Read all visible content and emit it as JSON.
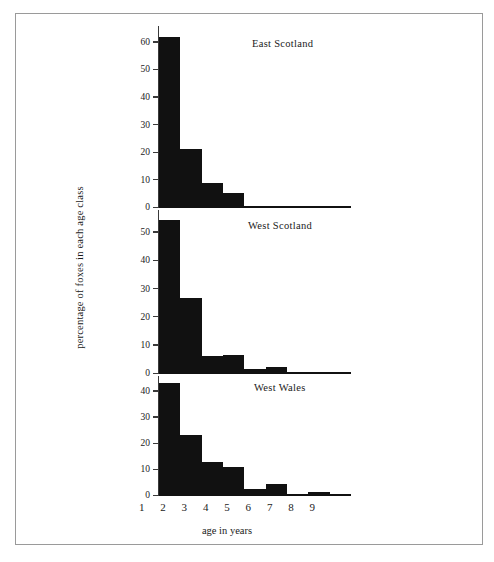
{
  "chart_data": {
    "type": "bar",
    "title": "",
    "xlabel": "age in years",
    "ylabel": "percentage of foxes in each age class",
    "categories": [
      "1",
      "2",
      "3",
      "4",
      "5",
      "6",
      "7",
      "8",
      "9"
    ],
    "grid": false,
    "legend": "none",
    "panels": [
      {
        "title": "East Scotland",
        "values": [
          62,
          21.5,
          9,
          5.5,
          0.8,
          0.8,
          0.8,
          0.8,
          0.8
        ],
        "yticks": [
          0,
          10,
          20,
          30,
          40,
          50,
          60
        ],
        "ylim": [
          0,
          66
        ]
      },
      {
        "title": "West Scotland",
        "values": [
          54.5,
          27,
          6.5,
          6.7,
          1.7,
          2.5,
          0.6,
          0.6,
          0.6
        ],
        "yticks": [
          0,
          10,
          20,
          30,
          40,
          50
        ],
        "ylim": [
          0,
          58
        ]
      },
      {
        "title": "West Wales",
        "values": [
          43.5,
          23.5,
          13,
          11,
          2.5,
          4.5,
          0.7,
          1.4,
          0.6
        ],
        "yticks": [
          0,
          10,
          20,
          30,
          40
        ],
        "ylim": [
          0,
          46
        ]
      }
    ],
    "colors": {
      "bar": "#111111",
      "axis": "#3a3a3a",
      "frame": "#9a9a9a",
      "text": "#1a1a1a"
    }
  }
}
